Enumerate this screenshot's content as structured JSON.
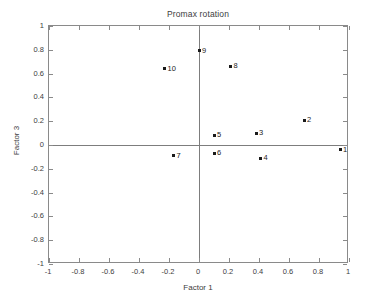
{
  "chart_data": {
    "type": "scatter",
    "title": "Promax rotation",
    "xlabel": "Factor 1",
    "ylabel": "Factor 3",
    "xlim": [
      -1,
      1
    ],
    "ylim": [
      -1,
      1
    ],
    "grid": false,
    "legend": null,
    "xticks": [
      "-1",
      "-0.8",
      "-0.6",
      "-0.4",
      "-0.2",
      "0",
      "0.2",
      "0.4",
      "0.6",
      "0.8",
      "1"
    ],
    "xtickvalues": [
      -1,
      -0.8,
      -0.6,
      -0.4,
      -0.2,
      0,
      0.2,
      0.4,
      0.6,
      0.8,
      1
    ],
    "yticks": [
      "1",
      "0.8",
      "0.6",
      "0.4",
      "0.2",
      "0",
      "-0.2",
      "-0.4",
      "-0.6",
      "-0.8",
      "-1"
    ],
    "ytickvalues": [
      1,
      0.8,
      0.6,
      0.4,
      0.2,
      0,
      -0.2,
      -0.4,
      -0.6,
      -0.8,
      -1
    ],
    "points": [
      {
        "label": "1",
        "x": 0.94,
        "y": -0.04
      },
      {
        "label": "2",
        "x": 0.7,
        "y": 0.21
      },
      {
        "label": "3",
        "x": 0.38,
        "y": 0.1
      },
      {
        "label": "4",
        "x": 0.41,
        "y": -0.11
      },
      {
        "label": "5",
        "x": 0.1,
        "y": 0.08
      },
      {
        "label": "6",
        "x": 0.1,
        "y": -0.07
      },
      {
        "label": "7",
        "x": -0.17,
        "y": -0.09
      },
      {
        "label": "8",
        "x": 0.21,
        "y": 0.66
      },
      {
        "label": "9",
        "x": 0.0,
        "y": 0.79
      },
      {
        "label": "10",
        "x": -0.23,
        "y": 0.64
      }
    ],
    "colors": {
      "marker": "#1a1a1a",
      "axis": "#8a8a8a",
      "zero_line": "#7d7d7d",
      "text": "#3d3d3d",
      "background": "#ffffff"
    }
  }
}
